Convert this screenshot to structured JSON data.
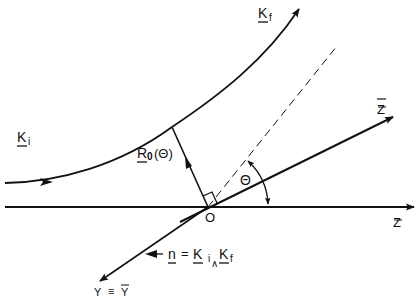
{
  "diagram": {
    "title": "",
    "colors": {
      "ink": "#111111",
      "background": "#ffffff"
    },
    "labels": {
      "k_f": {
        "main": "K",
        "sub": "f"
      },
      "k_i": {
        "main": "K",
        "sub": "i"
      },
      "r0": {
        "main": "R",
        "sub": "0",
        "arg": "(Θ)"
      },
      "theta": "Θ",
      "origin": "O",
      "z_bar": "Z",
      "z": "Z",
      "y_eq": {
        "left": "Y",
        "eq": "≡",
        "right": "Y"
      },
      "normal": {
        "n": "n",
        "eq": "=",
        "k1": "K",
        "sub_i": "i",
        "wedge": "∧",
        "k2": "K",
        "sub_f": "f"
      }
    },
    "elements": [
      "incoming-trajectory-ki",
      "outgoing-trajectory-kf",
      "impact-vector-r0",
      "z-axis",
      "z-bar-axis",
      "y-axis",
      "dashed-asymptote",
      "theta-angle-arc",
      "right-angle-marker"
    ]
  }
}
